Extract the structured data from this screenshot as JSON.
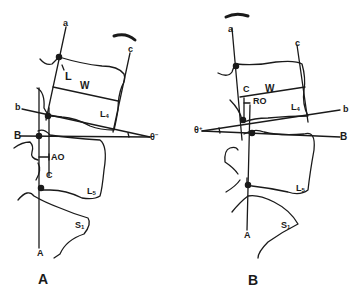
{
  "panels": [
    {
      "id": "A",
      "caption": "A",
      "labels": {
        "line_a": "a",
        "line_b": "b",
        "line_B": "B",
        "line_c": "c",
        "line_C": "C",
        "line_A": "A",
        "point_L": "L",
        "width": "W",
        "offset": "AO",
        "angle": "θ",
        "angle_sign": "−",
        "vertebra_upper": "L",
        "vertebra_upper_sub": "4",
        "vertebra_lower": "L",
        "vertebra_lower_sub": "5",
        "sacrum": "S",
        "sacrum_sub": "1"
      }
    },
    {
      "id": "B",
      "caption": "B",
      "labels": {
        "line_a": "a",
        "line_b": "b",
        "line_B": "B",
        "line_c": "c",
        "line_C": "C",
        "line_A": "A",
        "width": "W",
        "offset": "RO",
        "angle": "θ",
        "angle_sign": "+",
        "vertebra_upper": "L",
        "vertebra_upper_sub": "4",
        "vertebra_lower": "L",
        "vertebra_lower_sub": "5",
        "sacrum": "S",
        "sacrum_sub": "1"
      }
    }
  ],
  "colors": {
    "ink": "#1a1a1a",
    "background": "#ffffff"
  }
}
